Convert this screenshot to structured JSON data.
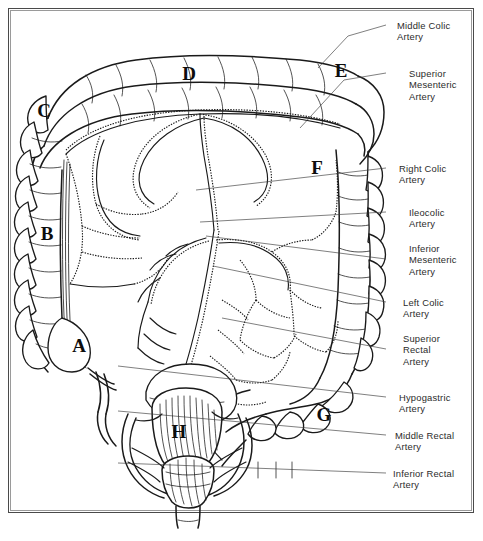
{
  "figure": {
    "frame_color": "#4a4a4a",
    "ink_color": "#1a1a1a",
    "label_text_color": "#2b2b2b"
  },
  "callouts": [
    {
      "id": "middle-colic-artery",
      "text": "Middle Colic\nArtery",
      "x": 397,
      "y": 20,
      "leader": {
        "dash_x1": 386,
        "dash_x2": 394,
        "dash_y": 25,
        "path": "M386,25 L348,36 L318,68"
      }
    },
    {
      "id": "superior-mesenteric-artery",
      "text": "Superior\nMesenteric\nArtery",
      "x": 409,
      "y": 68,
      "leader": {
        "dash_x1": 386,
        "dash_x2": 406,
        "dash_y": 73,
        "path": "M386,73 L344,80 L300,128"
      }
    },
    {
      "id": "right-colic-artery",
      "text": "Right Colic\nArtery",
      "x": 399,
      "y": 163,
      "leader": {
        "dash_x1": 386,
        "dash_x2": 396,
        "dash_y": 168,
        "path": "M386,168 L196,190"
      }
    },
    {
      "id": "ileocolic-artery",
      "text": "Ileocolic\nArtery",
      "x": 409,
      "y": 207,
      "leader": {
        "dash_x1": 386,
        "dash_x2": 406,
        "dash_y": 212,
        "path": "M386,212 L200,222"
      }
    },
    {
      "id": "inferior-mesenteric-artery",
      "text": "Inferior\nMesenteric\nArtery",
      "x": 409,
      "y": 243,
      "leader": {
        "dash_x1": 386,
        "dash_x2": 406,
        "dash_y": 259,
        "path": "M386,259 L206,236"
      }
    },
    {
      "id": "left-colic-artery",
      "text": "Left Colic\nArtery",
      "x": 403,
      "y": 297,
      "leader": {
        "dash_x1": 386,
        "dash_x2": 400,
        "dash_y": 302,
        "path": "M386,302 L213,266"
      }
    },
    {
      "id": "superior-rectal-artery",
      "text": "Superior\nRectal\nArtery",
      "x": 403,
      "y": 333,
      "leader": {
        "dash_x1": 386,
        "dash_x2": 400,
        "dash_y": 349,
        "path": "M386,349 L222,318"
      }
    },
    {
      "id": "hypogastric-artery",
      "text": "Hypogastric\nArtery",
      "x": 399,
      "y": 392,
      "leader": {
        "dash_x1": 386,
        "dash_x2": 396,
        "dash_y": 397,
        "path": "M386,397 L118,366"
      }
    },
    {
      "id": "middle-rectal-artery",
      "text": "Middle Rectal\nArtery",
      "x": 395,
      "y": 430,
      "leader": {
        "dash_x1": 386,
        "dash_x2": 392,
        "dash_y": 435,
        "path": "M386,435 L118,411"
      }
    },
    {
      "id": "inferior-rectal-artery",
      "text": "Inferior Rectal\nArtery",
      "x": 393,
      "y": 468,
      "leader": {
        "dash_x1": 386,
        "dash_x2": 390,
        "dash_y": 473,
        "path": "M386,473 L118,463"
      }
    }
  ],
  "markers": [
    {
      "id": "marker-a",
      "letter": "A",
      "x": 78,
      "y": 346
    },
    {
      "id": "marker-b",
      "letter": "B",
      "x": 46,
      "y": 234
    },
    {
      "id": "marker-c",
      "letter": "C",
      "x": 43,
      "y": 111
    },
    {
      "id": "marker-d",
      "letter": "D",
      "x": 188,
      "y": 74
    },
    {
      "id": "marker-e",
      "letter": "E",
      "x": 340,
      "y": 71
    },
    {
      "id": "marker-f",
      "letter": "F",
      "x": 316,
      "y": 168
    },
    {
      "id": "marker-g",
      "letter": "G",
      "x": 323,
      "y": 415
    },
    {
      "id": "marker-h",
      "letter": "H",
      "x": 178,
      "y": 432
    }
  ]
}
